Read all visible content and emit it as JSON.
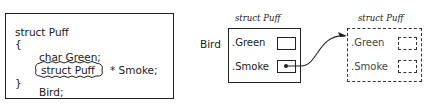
{
  "code_panel": {
    "lines": [
      "struct Puff",
      "{",
      "char Green;",
      "struct Puff",
      "* Smoke;",
      "}",
      "Bird;"
    ],
    "highlighted_type": "struct Puff"
  },
  "bird_struct": {
    "caption": "struct Puff",
    "variable_label": "Bird",
    "fields": [
      {
        "name": ".Green",
        "value": ""
      },
      {
        "name": ".Smoke",
        "value": "pointer"
      }
    ]
  },
  "pointed_struct": {
    "caption": "struct Puff",
    "style": "dashed",
    "fields": [
      {
        "name": ".Green",
        "value": ""
      },
      {
        "name": ".Smoke",
        "value": ""
      }
    ]
  },
  "arrow": {
    "from": "Bird.Smoke",
    "to": "pointed_struct"
  },
  "colors": {
    "ink": "#222222",
    "background": "#ffffff"
  }
}
